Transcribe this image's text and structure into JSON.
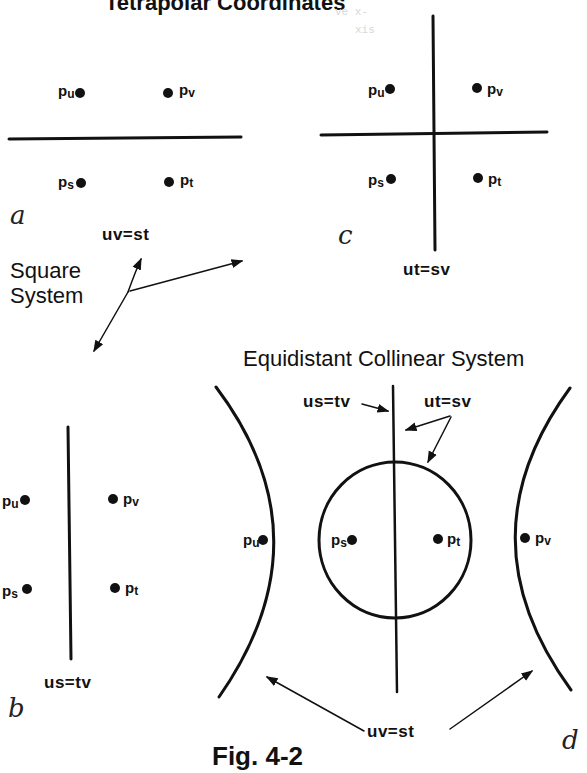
{
  "header": {
    "title_partial": "Tetrapolar Coordinates",
    "ghost_text": [
      "ve x-",
      "xis",
      "..."
    ]
  },
  "panels": {
    "a": {
      "letter": "a",
      "equation": "uv=st",
      "points": [
        {
          "name": "p",
          "sub": "u"
        },
        {
          "name": "p",
          "sub": "v"
        },
        {
          "name": "p",
          "sub": "s"
        },
        {
          "name": "p",
          "sub": "t"
        }
      ]
    },
    "b": {
      "letter": "b",
      "equation": "us=tv",
      "points": [
        {
          "name": "p",
          "sub": "u"
        },
        {
          "name": "p",
          "sub": "v"
        },
        {
          "name": "p",
          "sub": "s"
        },
        {
          "name": "p",
          "sub": "t"
        }
      ]
    },
    "c": {
      "letter": "c",
      "equation": "ut=sv",
      "points": [
        {
          "name": "p",
          "sub": "u"
        },
        {
          "name": "p",
          "sub": "v"
        },
        {
          "name": "p",
          "sub": "s"
        },
        {
          "name": "p",
          "sub": "t"
        }
      ]
    },
    "d": {
      "letter": "d",
      "title": "Equidistant Collinear System",
      "equation_line": "us=tv",
      "equation_circle": "ut=sv",
      "equation_hyperbolas": "uv=st",
      "points": [
        {
          "name": "p",
          "sub": "u"
        },
        {
          "name": "p",
          "sub": "s"
        },
        {
          "name": "p",
          "sub": "t"
        },
        {
          "name": "p",
          "sub": "v"
        }
      ]
    }
  },
  "square_system_label": [
    "Square",
    "System"
  ],
  "caption": "Fig. 4-2",
  "colors": {
    "ink": "#111111",
    "background": "#ffffff"
  }
}
